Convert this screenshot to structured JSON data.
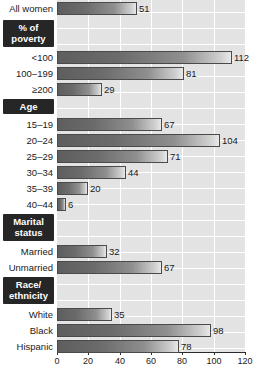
{
  "chart_data": {
    "type": "bar",
    "orientation": "horizontal",
    "title": "",
    "subtitle": "",
    "xlabel": "",
    "ylabel": "",
    "xlim": [
      0,
      120
    ],
    "xticks": [
      0,
      20,
      40,
      60,
      80,
      100,
      120
    ],
    "grid": true,
    "legend": "none",
    "categories": [
      "All women",
      "<100",
      "100–199",
      "≥200",
      "15–19",
      "20–24",
      "25–29",
      "30–34",
      "35–39",
      "40–44",
      "Married",
      "Unmarried",
      "White",
      "Black",
      "Hispanic"
    ],
    "values": [
      51,
      112,
      81,
      29,
      67,
      104,
      71,
      44,
      20,
      6,
      32,
      67,
      35,
      98,
      78
    ],
    "groups": [
      {
        "header": "",
        "header_lines": [],
        "rows": [
          {
            "label": "All women",
            "value": 51
          }
        ]
      },
      {
        "header": "% of poverty",
        "header_lines": [
          "% of",
          "poverty"
        ],
        "rows": [
          {
            "label": "<100",
            "value": 112
          },
          {
            "label": "100–199",
            "value": 81
          },
          {
            "label": "≥200",
            "value": 29
          }
        ]
      },
      {
        "header": "Age",
        "header_lines": [
          "Age"
        ],
        "rows": [
          {
            "label": "15–19",
            "value": 67
          },
          {
            "label": "20–24",
            "value": 104
          },
          {
            "label": "25–29",
            "value": 71
          },
          {
            "label": "30–34",
            "value": 44
          },
          {
            "label": "35–39",
            "value": 20
          },
          {
            "label": "40–44",
            "value": 6
          }
        ]
      },
      {
        "header": "Marital status",
        "header_lines": [
          "Marital",
          "status"
        ],
        "rows": [
          {
            "label": "Married",
            "value": 32
          },
          {
            "label": "Unmarried",
            "value": 67
          }
        ]
      },
      {
        "header": "Race/ethnicity",
        "header_lines": [
          "Race/",
          "ethnicity"
        ],
        "rows": [
          {
            "label": "White",
            "value": 35
          },
          {
            "label": "Black",
            "value": 98
          },
          {
            "label": "Hispanic",
            "value": 78
          }
        ]
      }
    ],
    "colors": {
      "plot_background": "#e3e3e3",
      "gridline": "#ffffff",
      "bar_dark": "#5e5e5e",
      "bar_light": "#e8e8e8",
      "bar_border": "#4a4a4a",
      "header_box": "#262626",
      "header_text": "#ffffff",
      "text": "#1a1a1a",
      "axis": "#2b2b2b"
    }
  },
  "footer": {
    "copyright": "Copyright © Cengage Learning 2012"
  }
}
